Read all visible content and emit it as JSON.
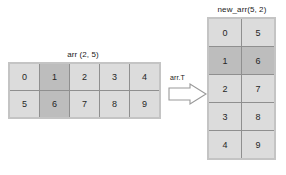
{
  "diagram": {
    "background_color": "#ffffff",
    "cell_color": "#dcdcdc",
    "highlight_color": "#bdbdbd",
    "frame_color": "#c4c4c4",
    "grid_line_color": "#8f8f8f",
    "text_color": "#262626"
  },
  "left_matrix": {
    "title": "arr (2, 5)",
    "rows": 2,
    "cols": 5,
    "values": [
      [
        "0",
        "1",
        "2",
        "3",
        "4"
      ],
      [
        "5",
        "6",
        "7",
        "8",
        "9"
      ]
    ],
    "highlighted_column_index": 1,
    "highlighted_values": [
      "1",
      "6"
    ]
  },
  "operation": {
    "label": "arr.T",
    "arrow_icon": "right-block-arrow-icon",
    "direction": "right"
  },
  "right_matrix": {
    "title": "new_arr(5, 2)",
    "rows": 5,
    "cols": 2,
    "values": [
      [
        "0",
        "5"
      ],
      [
        "1",
        "6"
      ],
      [
        "2",
        "7"
      ],
      [
        "3",
        "8"
      ],
      [
        "4",
        "9"
      ]
    ],
    "highlighted_row_index": 1,
    "highlighted_values": [
      "1",
      "6"
    ]
  }
}
